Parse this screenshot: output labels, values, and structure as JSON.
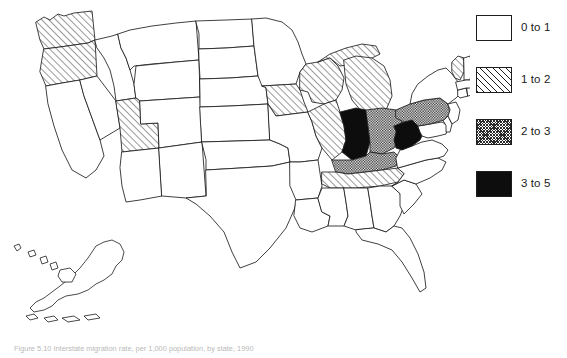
{
  "figure": {
    "caption": "Figure 5.10  Interstate migration rate, per 1,000 population, by state, 1990"
  },
  "legend": {
    "title": "",
    "items": [
      {
        "label": "0 to 1",
        "pattern": "none",
        "swatch_fill": "#ffffff"
      },
      {
        "label": "1 to 2",
        "pattern": "hatch",
        "swatch_fill": "#ffffff"
      },
      {
        "label": "2 to 3",
        "pattern": "check",
        "swatch_fill": "#ffffff"
      },
      {
        "label": "3 to 5",
        "pattern": "solid",
        "swatch_fill": "#0d0d0d"
      }
    ]
  },
  "map": {
    "type": "choropleth",
    "region": "United States",
    "outline_color": "#1d1d1d",
    "background_color": "#ffffff",
    "insets": [
      "Alaska",
      "Hawaii"
    ],
    "state_classes": {
      "Washington": "1 to 2",
      "Oregon": "1 to 2",
      "California": "0 to 1",
      "Nevada": "0 to 1",
      "Idaho": "0 to 1",
      "Montana": "0 to 1",
      "Wyoming": "0 to 1",
      "Utah": "1 to 2",
      "Colorado": "0 to 1",
      "Arizona": "0 to 1",
      "New Mexico": "0 to 1",
      "North Dakota": "0 to 1",
      "South Dakota": "0 to 1",
      "Nebraska": "0 to 1",
      "Kansas": "0 to 1",
      "Oklahoma": "0 to 1",
      "Texas": "0 to 1",
      "Minnesota": "0 to 1",
      "Iowa": "1 to 2",
      "Missouri": "0 to 1",
      "Arkansas": "0 to 1",
      "Louisiana": "0 to 1",
      "Wisconsin": "1 to 2",
      "Illinois": "1 to 2",
      "Michigan": "1 to 2",
      "Indiana": "3 to 5",
      "Ohio": "2 to 3",
      "Kentucky": "2 to 3",
      "Tennessee": "1 to 2",
      "Mississippi": "0 to 1",
      "Alabama": "0 to 1",
      "Georgia": "0 to 1",
      "Florida": "0 to 1",
      "South Carolina": "0 to 1",
      "North Carolina": "0 to 1",
      "Virginia": "0 to 1",
      "West Virginia": "3 to 5",
      "Maryland": "0 to 1",
      "Delaware": "0 to 1",
      "Pennsylvania": "2 to 3",
      "New Jersey": "0 to 1",
      "New York": "0 to 1",
      "Connecticut": "0 to 1",
      "Rhode Island": "0 to 1",
      "Massachusetts": "0 to 1",
      "Vermont": "1 to 2",
      "New Hampshire": "0 to 1",
      "Maine": "0 to 1",
      "Alaska": "0 to 1",
      "Hawaii": "0 to 1"
    }
  }
}
